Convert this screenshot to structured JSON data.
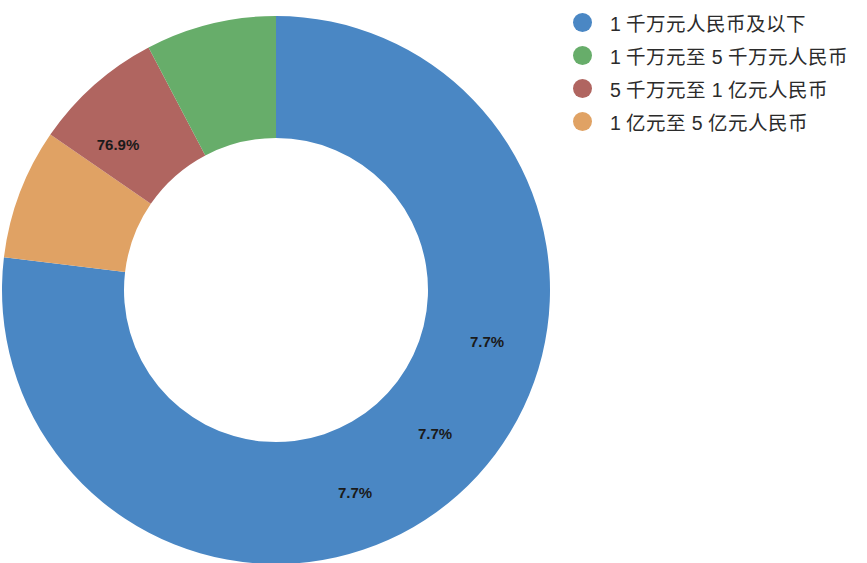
{
  "chart_data": {
    "type": "pie",
    "variant": "donut",
    "title": "",
    "subtitle": "",
    "xlabel": "",
    "ylabel": "",
    "grid": false,
    "legend_position": "right",
    "start_angle_deg": 0,
    "direction": "clockwise",
    "categories": [
      "1 千万元人民币及以下",
      "1 千万元至 5 千万元人民币",
      "5 千万元至 1 亿元人民币",
      "1 亿元至 5 亿元人民币"
    ],
    "values": [
      76.9,
      7.7,
      7.7,
      7.7
    ],
    "value_labels": [
      "76.9%",
      "7.7%",
      "7.7%",
      "7.7%"
    ],
    "colors": [
      "#4a87c4",
      "#67ad6a",
      "#b06560",
      "#e0a264"
    ],
    "slices": [
      {
        "label": "1 千万元人民币及以下",
        "value": 76.9,
        "display": "76.9%",
        "color": "#4a87c4"
      },
      {
        "label": "1 亿元至 5 亿元人民币",
        "value": 7.7,
        "display": "7.7%",
        "color": "#e0a264"
      },
      {
        "label": "5 千万元至 1 亿元人民币",
        "value": 7.7,
        "display": "7.7%",
        "color": "#b06560"
      },
      {
        "label": "1 千万元至 5 千万元人民币",
        "value": 7.7,
        "display": "7.7%",
        "color": "#67ad6a"
      }
    ]
  },
  "labels": {
    "blue": "76.9%",
    "orange": "7.7%",
    "red": "7.7%",
    "green": "7.7%"
  },
  "legend": {
    "items": [
      {
        "label": "1 千万元人民币及以下",
        "color": "#4a87c4",
        "marker": "circle-marker"
      },
      {
        "label": "1 千万元至 5 千万元人民币",
        "color": "#67ad6a",
        "marker": "circle-marker"
      },
      {
        "label": "5 千万元至 1 亿元人民币",
        "color": "#b06560",
        "marker": "circle-marker"
      },
      {
        "label": "1 亿元至 5 亿元人民币",
        "color": "#e0a264",
        "marker": "circle-marker"
      }
    ]
  }
}
